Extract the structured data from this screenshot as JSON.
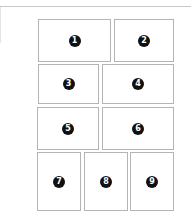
{
  "layout": {
    "rows": [
      {
        "panels": [
          {
            "label": "1"
          },
          {
            "label": "2"
          }
        ]
      },
      {
        "panels": [
          {
            "label": "3"
          },
          {
            "label": "4"
          }
        ]
      },
      {
        "panels": [
          {
            "label": "5"
          },
          {
            "label": "6"
          }
        ]
      },
      {
        "panels": [
          {
            "label": "7"
          },
          {
            "label": "8"
          },
          {
            "label": "9"
          }
        ]
      }
    ]
  },
  "colors": {
    "border": "#b4b4b4",
    "badge": "#111111",
    "badge_text": "#ffffff"
  }
}
